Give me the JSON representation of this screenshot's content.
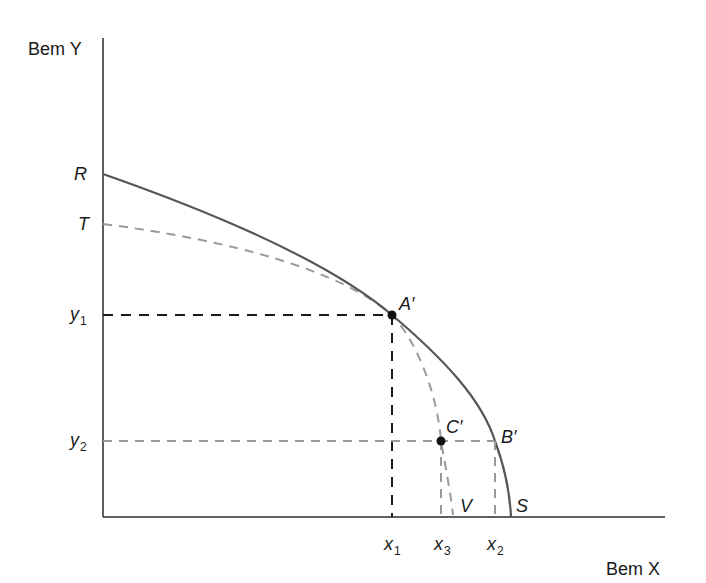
{
  "diagram": {
    "title": "",
    "axes": {
      "y_label": "Bem Y",
      "x_label": "Bem X"
    },
    "y_intercepts": [
      {
        "id": "R",
        "label": "R"
      },
      {
        "id": "T",
        "label": "T"
      }
    ],
    "y_ticks": [
      {
        "id": "y1",
        "base": "y",
        "sub": "1"
      },
      {
        "id": "y2",
        "base": "y",
        "sub": "2"
      }
    ],
    "x_ticks": [
      {
        "id": "x1",
        "base": "x",
        "sub": "1"
      },
      {
        "id": "x3",
        "base": "x",
        "sub": "3"
      },
      {
        "id": "x2",
        "base": "x",
        "sub": "2"
      }
    ],
    "points": [
      {
        "id": "A",
        "label": "A′"
      },
      {
        "id": "B",
        "label": "B′"
      },
      {
        "id": "C",
        "label": "C′"
      }
    ],
    "x_intercepts": [
      {
        "id": "V",
        "label": "V"
      },
      {
        "id": "S",
        "label": "S"
      }
    ],
    "curves": [
      {
        "name": "RS",
        "style": "solid",
        "color": "#555555",
        "description": "Production possibility frontier from R to S"
      },
      {
        "name": "TV",
        "style": "dashed",
        "color": "#9a9a9a",
        "description": "Production possibility frontier from T to V"
      }
    ],
    "colors": {
      "axis": "#2a2a2a",
      "solid_curve": "#555555",
      "dashed_gray": "#9a9a9a",
      "dashed_black": "#1a1a1a",
      "point": "#111111"
    }
  }
}
